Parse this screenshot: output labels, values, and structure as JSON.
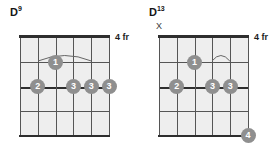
{
  "page": {
    "background_color": "#ffffff"
  },
  "style": {
    "dot_color": "#8f8f8f",
    "dot_text_color": "#ffffff",
    "grid_fill": "#eeeeee",
    "line_color": "#555555",
    "nut_color": "#2e2e2e",
    "text_color": "#151515"
  },
  "chords": [
    {
      "id": "chord-0",
      "root": "D",
      "extension": "9",
      "full_name": "D9",
      "position_label": "4 fr",
      "strings": 6,
      "frets": 4,
      "open_mute_markers": [],
      "barre_arcs": [
        {
          "from_string": 2,
          "to_string": 5,
          "fret": 1
        }
      ],
      "dots": [
        {
          "string": 3,
          "fret": 1,
          "finger": "1"
        },
        {
          "string": 2,
          "fret": 2,
          "finger": "2"
        },
        {
          "string": 4,
          "fret": 2,
          "finger": "3"
        },
        {
          "string": 5,
          "fret": 2,
          "finger": "3"
        },
        {
          "string": 6,
          "fret": 2,
          "finger": "3"
        }
      ]
    },
    {
      "id": "chord-1",
      "root": "D",
      "extension": "13",
      "full_name": "D13",
      "position_label": "4 fr",
      "strings": 6,
      "frets": 4,
      "open_mute_markers": [
        {
          "string": 1,
          "symbol": "X",
          "meaning": "muted"
        }
      ],
      "barre_arcs": [
        {
          "from_string": 4,
          "to_string": 5,
          "fret": 1
        }
      ],
      "dots": [
        {
          "string": 3,
          "fret": 1,
          "finger": "1"
        },
        {
          "string": 2,
          "fret": 2,
          "finger": "2"
        },
        {
          "string": 4,
          "fret": 2,
          "finger": "3"
        },
        {
          "string": 5,
          "fret": 2,
          "finger": "3"
        },
        {
          "string": 6,
          "fret": 4,
          "finger": "4"
        }
      ]
    }
  ]
}
